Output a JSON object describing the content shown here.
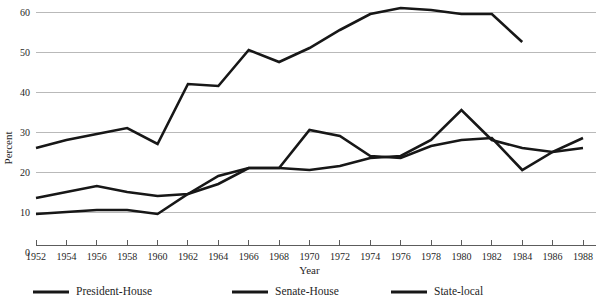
{
  "chart_data": {
    "type": "line",
    "title": "",
    "subtitle": "",
    "xlabel": "Year",
    "ylabel": "Percent",
    "x": [
      1952,
      1954,
      1956,
      1958,
      1960,
      1962,
      1964,
      1966,
      1968,
      1970,
      1972,
      1974,
      1976,
      1978,
      1980,
      1982,
      1984,
      1986,
      1988
    ],
    "xtick_labels": [
      "1952",
      "1954",
      "1956",
      "1958",
      "1960",
      "1962",
      "1964",
      "1966",
      "1968",
      "1970",
      "1972",
      "1974",
      "1976",
      "1978",
      "1980",
      "1982",
      "1984",
      "1986",
      "1988"
    ],
    "ytick_labels": [
      "0",
      "10",
      "20",
      "30",
      "40",
      "50",
      "60"
    ],
    "yticks": [
      0,
      10,
      20,
      30,
      40,
      50,
      60
    ],
    "xlim": [
      1952,
      1988
    ],
    "ylim": [
      0,
      60
    ],
    "grid": "horizontal",
    "legend_position": "bottom",
    "series": [
      {
        "name": "President-House",
        "color": "#171717",
        "x": [
          1952,
          1954,
          1956,
          1958,
          1960,
          1962,
          1964,
          1966,
          1968,
          1970,
          1972,
          1974,
          1976,
          1978,
          1980,
          1982,
          1984
        ],
        "values": [
          26,
          28,
          29.5,
          31,
          27,
          42,
          41.5,
          50.5,
          47.5,
          51,
          55.5,
          59.5,
          61,
          60.5,
          59.5,
          59.5,
          52.5
        ]
      },
      {
        "name": "Senate-House",
        "color": "#171717",
        "x": [
          1952,
          1954,
          1956,
          1958,
          1960,
          1962,
          1964,
          1966,
          1968,
          1970,
          1972,
          1974,
          1976,
          1978,
          1980,
          1982,
          1984,
          1986,
          1988
        ],
        "values": [
          13.5,
          15,
          16.5,
          15,
          14,
          14.5,
          19,
          21,
          21,
          20.5,
          21.5,
          23.5,
          24,
          28,
          35.5,
          28,
          26,
          25,
          28.5
        ]
      },
      {
        "name": "State-local",
        "color": "#171717",
        "x": [
          1952,
          1954,
          1956,
          1958,
          1960,
          1962,
          1964,
          1966,
          1968,
          1970,
          1972,
          1974,
          1976,
          1978,
          1980,
          1982,
          1984,
          1986,
          1988
        ],
        "values": [
          9.5,
          10,
          10.5,
          10.5,
          9.5,
          14.5,
          17,
          21,
          21,
          30.5,
          29,
          24,
          23.5,
          26.5,
          28,
          28.5,
          20.5,
          25,
          26
        ]
      }
    ]
  },
  "legend": {
    "items": [
      {
        "label": "President-House"
      },
      {
        "label": "Senate-House"
      },
      {
        "label": "State-local"
      }
    ]
  }
}
